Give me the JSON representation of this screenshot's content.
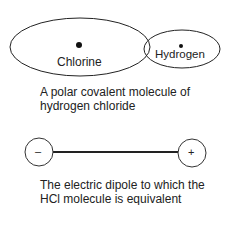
{
  "molecule": {
    "atom_left": "Chlorine",
    "atom_right": "Hydrogen",
    "caption_line1": "A polar covalent molecule of",
    "caption_line2": "hydrogen chloride"
  },
  "dipole": {
    "negative_sign": "–",
    "positive_sign": "+",
    "caption_line1": "The electric dipole to which the",
    "caption_line2": "HCl molecule is equivalent"
  }
}
